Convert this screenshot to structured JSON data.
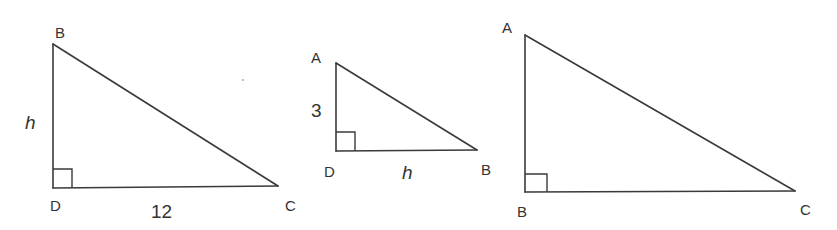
{
  "figure": {
    "stroke_color": "#3a3a3a",
    "label_color": "#333333"
  },
  "triangles": [
    {
      "id": "triangle-1",
      "vertices": {
        "top": "B",
        "right_angle": "D",
        "far": "C"
      },
      "right_angle_at": "D",
      "sides": {
        "vertical": "h",
        "horizontal": "12"
      }
    },
    {
      "id": "triangle-2",
      "vertices": {
        "top": "A",
        "right_angle": "D",
        "far": "B"
      },
      "right_angle_at": "D",
      "sides": {
        "vertical": "3",
        "horizontal": "h"
      }
    },
    {
      "id": "triangle-3",
      "vertices": {
        "top": "A",
        "right_angle": "B",
        "far": "C"
      },
      "right_angle_at": "B",
      "sides": {}
    }
  ]
}
